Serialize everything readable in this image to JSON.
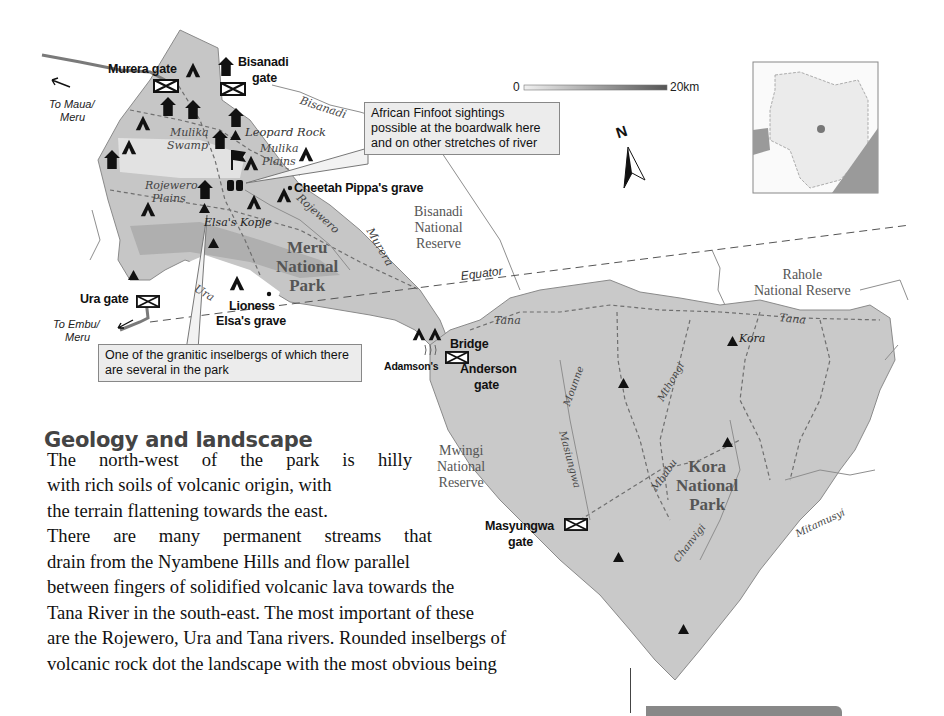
{
  "map": {
    "gates": {
      "murera": "Murera gate",
      "bisanadi_line1": "Bisanadi",
      "bisanadi_line2": "gate",
      "ura": "Ura gate",
      "anderson_line1": "Anderson",
      "anderson_line2": "gate",
      "masyungwa_line1": "Masyungwa",
      "masyungwa_line2": "gate"
    },
    "directions": {
      "maua_line1": "To Maua/",
      "maua_line2": "Meru",
      "embu_line1": "To Embu/",
      "embu_line2": "Meru"
    },
    "features": {
      "mulika_swamp_1": "Mulika",
      "mulika_swamp_2": "Swamp",
      "leopard_rock": "Leopard Rock",
      "mulika_plains_1": "Mulika",
      "mulika_plains_2": "Plains",
      "rojewero_plains_1": "Rojewero",
      "rojewero_plains_2": "Plains",
      "cheetah_grave": "Cheetah Pippa's grave",
      "elsas_kopje": "Elsa's Kopje",
      "lioness_1": "Lioness",
      "lioness_2": "Elsa's grave",
      "bridge": "Bridge",
      "adamsons": "Adamson's",
      "kora_peak": "Kora"
    },
    "rivers": {
      "bisanadi": "Bisanadi",
      "rojewero": "Rojewero",
      "murera": "Murera",
      "ura": "Ura",
      "tana_west": "Tana",
      "tana_east": "Tana",
      "mounne": "Mounne",
      "mthongi": "Mthongi",
      "masiungwa": "Masiungwa",
      "mbubu": "Mbubu",
      "chanvigi": "Chanvigi",
      "mitamusyi": "Mitamusyi",
      "equator": "Equator"
    },
    "areas": {
      "bisanadi_reserve": [
        "Bisanadi",
        "National",
        "Reserve"
      ],
      "meru_park": [
        "Meru",
        "National",
        "Park"
      ],
      "rahole_reserve": [
        "Rahole",
        "National Reserve"
      ],
      "mwingi_reserve": [
        "Mwingi",
        "National",
        "Reserve"
      ],
      "kora_park": [
        "Kora",
        "National",
        "Park"
      ]
    },
    "callouts": {
      "finfoot": "African Finfoot sightings possible at the boardwalk here and on other stretches of river",
      "inselberg": "One of the granitic inselbergs of which there are several in the park"
    },
    "scale_bar": {
      "start": "0",
      "end": "20km"
    },
    "north_arrow": "N",
    "colors": {
      "park_fill": "#c9c9c9",
      "park_dark_fill": "#b3b3b3",
      "swamp_fill": "#e2e2e2",
      "track": "#6f6f6f",
      "river": "#8a8a8a",
      "icon": "#111111",
      "inset_fill": "#e8e8e8",
      "inset_sea": "#9a9a9a"
    }
  },
  "article": {
    "heading": "Geology and landscape",
    "lines": [
      "The north-west of the park is hilly",
      "with rich soils of volcanic origin, with",
      "the terrain flattening towards the east.",
      "There are many permanent streams that",
      "drain from the Nyambene Hills and flow parallel",
      "between fingers of solidified volcanic lava towards the",
      "Tana River in the south-east. The most important of these",
      "are the Rojewero, Ura and Tana rivers. Rounded inselbergs of",
      "volcanic rock dot the landscape with the most obvious being"
    ]
  }
}
